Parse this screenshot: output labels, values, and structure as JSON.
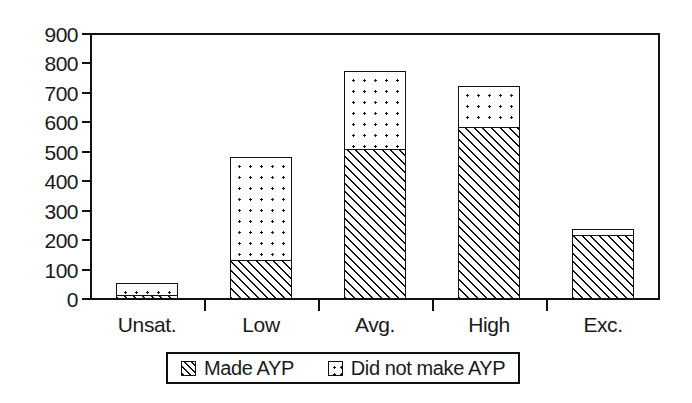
{
  "chart_data": {
    "type": "bar",
    "subtype": "stacked",
    "title": "",
    "xlabel": "",
    "ylabel": "",
    "categories": [
      "Unsat.",
      "Low",
      "Avg.",
      "High",
      "Exc."
    ],
    "series": [
      {
        "name": "Made AYP",
        "pattern": "diagonal-hatch",
        "values": [
          10,
          130,
          505,
          580,
          215
        ]
      },
      {
        "name": "Did not make AYP",
        "pattern": "dots",
        "values": [
          40,
          350,
          265,
          140,
          20
        ]
      }
    ],
    "totals": [
      50,
      480,
      770,
      720,
      235
    ],
    "ylim": [
      0,
      900
    ],
    "ytick_step": 100,
    "yticks": [
      "900",
      "800",
      "700",
      "600",
      "500",
      "400",
      "300",
      "200",
      "100",
      "0"
    ],
    "ytick_values": [
      900,
      800,
      700,
      600,
      500,
      400,
      300,
      200,
      100,
      0
    ],
    "grid": false,
    "legend_position": "bottom",
    "colors": {
      "ink": "#111111",
      "background": "#ffffff"
    }
  },
  "legend": {
    "entries": [
      {
        "label": "Made AYP",
        "swatch": "hatch-swatch-icon"
      },
      {
        "label": "Did not make AYP",
        "swatch": "dots-swatch-icon"
      }
    ]
  }
}
